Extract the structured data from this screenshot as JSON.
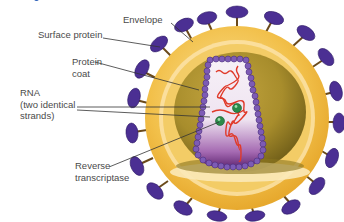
{
  "figure": {
    "title_fragment": "",
    "labels": {
      "envelope": "Envelope",
      "surface_protein": "Surface protein",
      "protein_coat": "Protein\ncoat",
      "rna": "RNA\n(two identical\nstrands)",
      "reverse_transcriptase": "Reverse\ntranscriptase"
    },
    "colors": {
      "envelope_outer": "#f2c04a",
      "envelope_light": "#f9dc8a",
      "envelope_inner_band": "#fbe9b8",
      "core_olive": "#a88d2c",
      "core_olive_dark": "#7d6a1e",
      "capsid_bead": "#7d5bb5",
      "capsid_fill_light": "#f4eef6",
      "capsid_fill_dark": "#6b2a7a",
      "rna": "#e03a2a",
      "enzyme": "#2a8a4a",
      "surface_protein": "#4b2f93",
      "stalk": "#6b4a1a",
      "leader_line": "#333333",
      "label_text": "#4a4a4a"
    }
  }
}
